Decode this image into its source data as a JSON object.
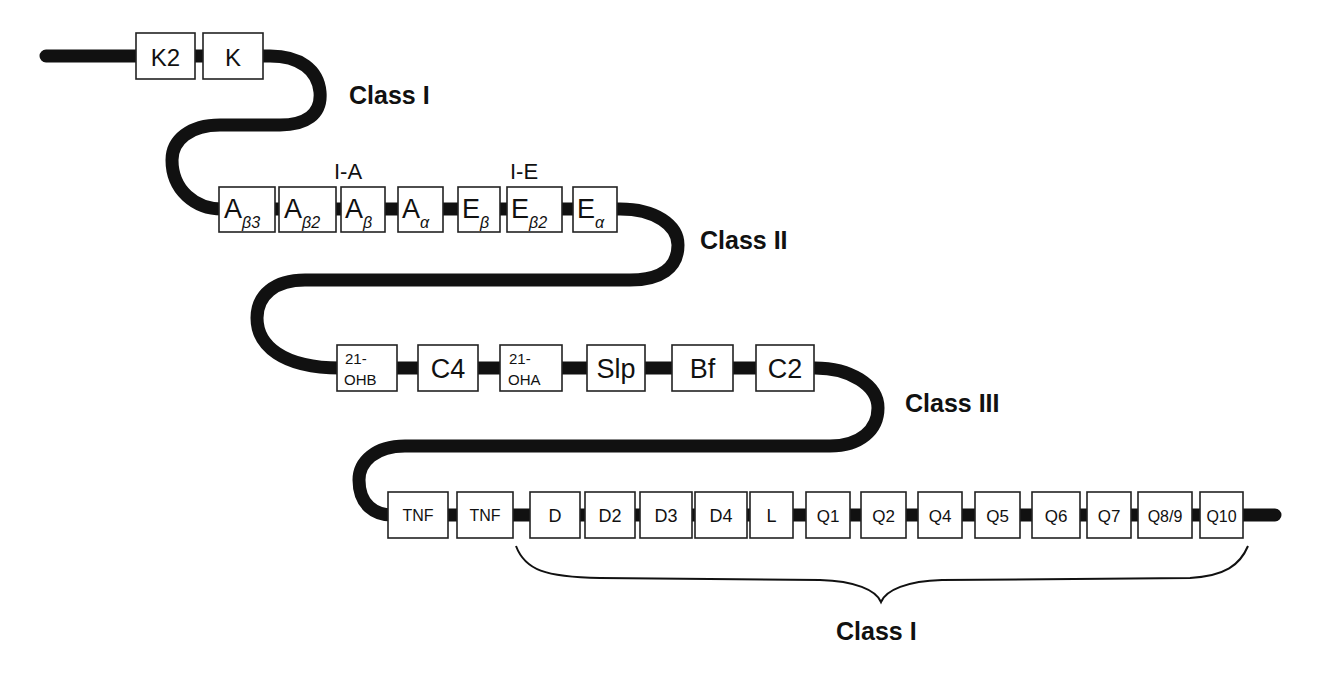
{
  "diagram": {
    "title": "",
    "region_labels": {
      "class_i_top": "Class I",
      "class_ii": "Class II",
      "class_iii": "Class III",
      "class_i_bottom": "Class I",
      "ia": "I-A",
      "ie": "I-E"
    },
    "rows": [
      {
        "name": "class-i-k-region",
        "y_top": 33,
        "y_bottom": 79,
        "genes": [
          {
            "id": "K2",
            "main": "K2",
            "sub": "",
            "x1": 136,
            "x2": 195
          },
          {
            "id": "K",
            "main": "K",
            "sub": "",
            "x1": 203,
            "x2": 263
          }
        ]
      },
      {
        "name": "class-ii-region",
        "y_top": 187,
        "y_bottom": 232,
        "genes": [
          {
            "id": "Ab3",
            "main": "A",
            "sub": "β3",
            "x1": 219,
            "x2": 275
          },
          {
            "id": "Ab2",
            "main": "A",
            "sub": "β2",
            "x1": 279,
            "x2": 336
          },
          {
            "id": "Ab",
            "main": "A",
            "sub": "β",
            "x1": 341,
            "x2": 385
          },
          {
            "id": "Aa",
            "main": "A",
            "sub": "α",
            "x1": 398,
            "x2": 443
          },
          {
            "id": "Eb",
            "main": "E",
            "sub": "β",
            "x1": 458,
            "x2": 500
          },
          {
            "id": "Eb2",
            "main": "E",
            "sub": "β2",
            "x1": 507,
            "x2": 562
          },
          {
            "id": "Ea",
            "main": "E",
            "sub": "α",
            "x1": 573,
            "x2": 617
          }
        ]
      },
      {
        "name": "class-iii-region",
        "y_top": 345,
        "y_bottom": 391,
        "genes": [
          {
            "id": "21-OHB",
            "line1": "21-",
            "line2": "OHB",
            "x1": 337,
            "x2": 397
          },
          {
            "id": "C4",
            "main": "C4",
            "x1": 418,
            "x2": 478
          },
          {
            "id": "21-OHA",
            "line1": "21-",
            "line2": "OHA",
            "x1": 500,
            "x2": 562
          },
          {
            "id": "Slp",
            "main": "Slp",
            "x1": 587,
            "x2": 645
          },
          {
            "id": "Bf",
            "main": "Bf",
            "x1": 672,
            "x2": 733
          },
          {
            "id": "C2",
            "main": "C2",
            "x1": 756,
            "x2": 814
          }
        ]
      },
      {
        "name": "class-i-d-l-q-region",
        "y_top": 492,
        "y_bottom": 538,
        "genes": [
          {
            "id": "TNF-1",
            "main": "TNF",
            "x1": 388,
            "x2": 448
          },
          {
            "id": "TNF-2",
            "main": "TNF",
            "x1": 457,
            "x2": 513
          },
          {
            "id": "D",
            "main": "D",
            "x1": 530,
            "x2": 585
          },
          {
            "id": "D2",
            "main": "D2",
            "x1": 585,
            "x2": 635
          },
          {
            "id": "D3",
            "main": "D3",
            "x1": 640,
            "x2": 692
          },
          {
            "id": "D4",
            "main": "D4",
            "x1": 695,
            "x2": 747
          },
          {
            "id": "L",
            "main": "L",
            "x1": 750,
            "x2": 793
          },
          {
            "id": "Q1",
            "main": "Q1",
            "x1": 806,
            "x2": 850
          },
          {
            "id": "Q2",
            "main": "Q2",
            "x1": 861,
            "x2": 906
          },
          {
            "id": "Q4",
            "main": "Q4",
            "x1": 918,
            "x2": 962
          },
          {
            "id": "Q5",
            "main": "Q5",
            "x1": 975,
            "x2": 1020
          },
          {
            "id": "Q6",
            "main": "Q6",
            "x1": 1032,
            "x2": 1080
          },
          {
            "id": "Q7",
            "main": "Q7",
            "x1": 1087,
            "x2": 1131
          },
          {
            "id": "Q8/9",
            "main": "Q8/9",
            "x1": 1138,
            "x2": 1192
          },
          {
            "id": "Q10",
            "main": "Q10",
            "x1": 1200,
            "x2": 1243
          }
        ]
      }
    ]
  },
  "colors": {
    "line": "#111111",
    "box_fill": "#ffffff",
    "box_stroke": "#222222",
    "background": "#ffffff"
  }
}
